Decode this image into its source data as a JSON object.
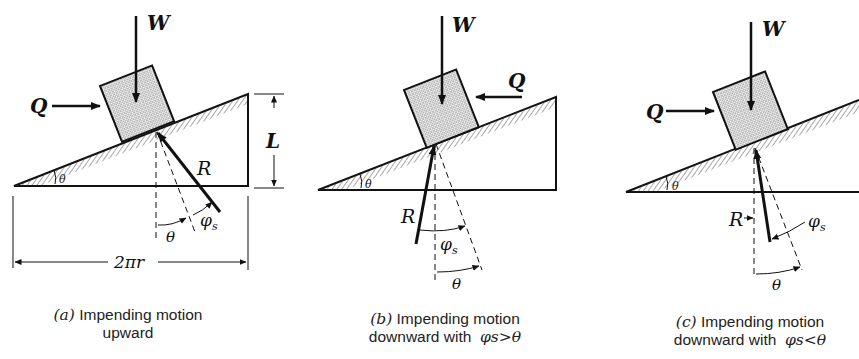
{
  "figure": {
    "panels": [
      {
        "id": "a",
        "force_weight": "W",
        "force_push": "Q",
        "force_reaction": "R",
        "incline_angle": "θ",
        "height_label": "L",
        "base_label": "2πr",
        "angle_theta": "θ",
        "angle_phi": "φ",
        "angle_phi_sub": "s",
        "caption_label": "(a)",
        "caption_line1": "Impending motion",
        "caption_line2": "upward"
      },
      {
        "id": "b",
        "force_weight": "W",
        "force_push": "Q",
        "force_reaction": "R",
        "incline_angle": "θ",
        "angle_theta": "θ",
        "angle_phi": "φ",
        "angle_phi_sub": "s",
        "caption_label": "(b)",
        "caption_line1": "Impending motion",
        "caption_line2_text": "downward with",
        "caption_line2_math": "φs>θ"
      },
      {
        "id": "c",
        "force_weight": "W",
        "force_push": "Q",
        "force_reaction": "R",
        "incline_angle": "θ",
        "angle_theta": "θ",
        "angle_phi": "φ",
        "angle_phi_sub": "s",
        "caption_label": "(c)",
        "caption_line1": "Impending motion",
        "caption_line2_text": "downward with",
        "caption_line2_math": "φs<θ"
      }
    ]
  }
}
